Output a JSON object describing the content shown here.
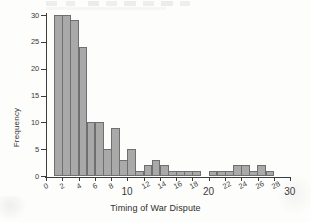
{
  "chart_data": {
    "type": "bar",
    "title": "",
    "xlabel": "Timing of War Dispute",
    "ylabel": "Frequency",
    "xlim": [
      0,
      30
    ],
    "ylim": [
      0,
      30
    ],
    "grid": false,
    "legend": "none",
    "bin_width": 1,
    "xticks": [
      0,
      2,
      4,
      6,
      8,
      10,
      12,
      14,
      16,
      18,
      20,
      22,
      24,
      26,
      28,
      30
    ],
    "xtick_labels": [
      "0",
      "2",
      "4",
      "6",
      "8",
      "10",
      "12",
      "14",
      "16",
      "18",
      "20",
      "22",
      "24",
      "26",
      "28",
      "30"
    ],
    "major_xticks": [
      "10",
      "20",
      "30"
    ],
    "yticks": [
      0,
      5,
      10,
      15,
      20,
      25,
      30
    ],
    "ytick_labels": [
      "0",
      "5",
      "10",
      "15",
      "20",
      "25",
      "30"
    ],
    "bar_color": "#a9a9a9",
    "bar_edge_color": "#6f6f6f",
    "axis_color": "#3c3c3c",
    "bins": [
      {
        "x0": 1,
        "x1": 2,
        "value": 30
      },
      {
        "x0": 2,
        "x1": 3,
        "value": 30
      },
      {
        "x0": 3,
        "x1": 4,
        "value": 29
      },
      {
        "x0": 4,
        "x1": 5,
        "value": 24
      },
      {
        "x0": 5,
        "x1": 6,
        "value": 10
      },
      {
        "x0": 6,
        "x1": 7,
        "value": 10
      },
      {
        "x0": 7,
        "x1": 8,
        "value": 5
      },
      {
        "x0": 8,
        "x1": 9,
        "value": 9
      },
      {
        "x0": 9,
        "x1": 10,
        "value": 3
      },
      {
        "x0": 10,
        "x1": 11,
        "value": 5
      },
      {
        "x0": 11,
        "x1": 12,
        "value": 1
      },
      {
        "x0": 12,
        "x1": 13,
        "value": 2
      },
      {
        "x0": 13,
        "x1": 14,
        "value": 3
      },
      {
        "x0": 14,
        "x1": 15,
        "value": 2
      },
      {
        "x0": 15,
        "x1": 16,
        "value": 1
      },
      {
        "x0": 16,
        "x1": 17,
        "value": 1
      },
      {
        "x0": 17,
        "x1": 18,
        "value": 1
      },
      {
        "x0": 18,
        "x1": 19,
        "value": 1
      },
      {
        "x0": 20,
        "x1": 21,
        "value": 1
      },
      {
        "x0": 21,
        "x1": 22,
        "value": 1
      },
      {
        "x0": 22,
        "x1": 23,
        "value": 1
      },
      {
        "x0": 23,
        "x1": 24,
        "value": 2
      },
      {
        "x0": 24,
        "x1": 25,
        "value": 2
      },
      {
        "x0": 25,
        "x1": 26,
        "value": 1
      },
      {
        "x0": 26,
        "x1": 27,
        "value": 2
      },
      {
        "x0": 27,
        "x1": 28,
        "value": 1
      }
    ]
  }
}
